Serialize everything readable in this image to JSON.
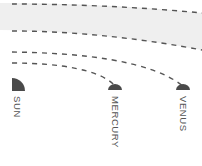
{
  "diagram": {
    "title": "",
    "bodies": [
      {
        "name": "sun",
        "label": "SUN"
      },
      {
        "name": "mercury",
        "label": "MERCURY"
      },
      {
        "name": "venus",
        "label": "VENUS"
      }
    ],
    "colors": {
      "body": "#4a4a4a",
      "orbit_dash": "#555555",
      "band_fill": "#efefef",
      "label": "#555555"
    }
  }
}
